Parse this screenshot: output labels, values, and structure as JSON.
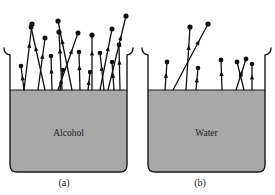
{
  "figure": {
    "background_color": "#ffffff",
    "liquid_fill_color": "#a8a8a8",
    "outline_color": "#1a1a1a",
    "molecule_color": "#111111"
  },
  "panels": [
    {
      "id": "a",
      "caption": "(a)",
      "liquid_label": "Alcohol",
      "beaker": {
        "left": 10,
        "right": 127,
        "top_lip_y": 48,
        "bottom_y": 172,
        "liquid_surface_y": 90
      },
      "escaping_molecules_count": 17,
      "vectors": [
        {
          "x1": 24,
          "y1": 90,
          "x2": 32,
          "y2": 24,
          "tip_r": 2.6,
          "barb_y": 0.72
        },
        {
          "x1": 24,
          "y1": 90,
          "x2": 21,
          "y2": 66,
          "tip_r": 2.3,
          "barb_y": 0.62
        },
        {
          "x1": 38,
          "y1": 90,
          "x2": 45,
          "y2": 38,
          "tip_r": 2.5,
          "barb_y": 0.7
        },
        {
          "x1": 45,
          "y1": 90,
          "x2": 31,
          "y2": 27,
          "tip_r": 2.5,
          "barb_y": 0.7
        },
        {
          "x1": 52,
          "y1": 90,
          "x2": 51,
          "y2": 56,
          "tip_r": 2.3,
          "barb_y": 0.64
        },
        {
          "x1": 60,
          "y1": 90,
          "x2": 63,
          "y2": 70,
          "tip_r": 2.3,
          "barb_y": 0.58
        },
        {
          "x1": 62,
          "y1": 90,
          "x2": 59,
          "y2": 32,
          "tip_r": 2.6,
          "barb_y": 0.72
        },
        {
          "x1": 72,
          "y1": 90,
          "x2": 58,
          "y2": 21,
          "tip_r": 2.6,
          "barb_y": 0.74
        },
        {
          "x1": 58,
          "y1": 90,
          "x2": 78,
          "y2": 33,
          "tip_r": 2.5,
          "barb_y": 0.72
        },
        {
          "x1": 80,
          "y1": 90,
          "x2": 79,
          "y2": 52,
          "tip_r": 2.3,
          "barb_y": 0.66
        },
        {
          "x1": 88,
          "y1": 90,
          "x2": 90,
          "y2": 72,
          "tip_r": 2.2,
          "barb_y": 0.56
        },
        {
          "x1": 92,
          "y1": 90,
          "x2": 92,
          "y2": 35,
          "tip_r": 2.6,
          "barb_y": 0.72
        },
        {
          "x1": 104,
          "y1": 90,
          "x2": 100,
          "y2": 53,
          "tip_r": 2.3,
          "barb_y": 0.66
        },
        {
          "x1": 100,
          "y1": 90,
          "x2": 112,
          "y2": 29,
          "tip_r": 2.5,
          "barb_y": 0.72
        },
        {
          "x1": 114,
          "y1": 90,
          "x2": 112,
          "y2": 62,
          "tip_r": 2.3,
          "barb_y": 0.62
        },
        {
          "x1": 108,
          "y1": 90,
          "x2": 126,
          "y2": 16,
          "tip_r": 2.6,
          "barb_y": 0.74
        },
        {
          "x1": 120,
          "y1": 90,
          "x2": 119,
          "y2": 45,
          "tip_r": 2.4,
          "barb_y": 0.68
        }
      ]
    },
    {
      "id": "b",
      "caption": "(b)",
      "liquid_label": "Water",
      "beaker": {
        "left": 148,
        "right": 265,
        "top_lip_y": 48,
        "bottom_y": 172,
        "liquid_surface_y": 90
      },
      "escaping_molecules_count": 8,
      "vectors": [
        {
          "x1": 165,
          "y1": 90,
          "x2": 167,
          "y2": 62,
          "tip_r": 2.4,
          "barb_y": 0.62
        },
        {
          "x1": 186,
          "y1": 90,
          "x2": 190,
          "y2": 27,
          "tip_r": 2.6,
          "barb_y": 0.72
        },
        {
          "x1": 173,
          "y1": 90,
          "x2": 208,
          "y2": 24,
          "tip_r": 2.6,
          "barb_y": 0.76
        },
        {
          "x1": 196,
          "y1": 90,
          "x2": 198,
          "y2": 68,
          "tip_r": 2.3,
          "barb_y": 0.58
        },
        {
          "x1": 222,
          "y1": 90,
          "x2": 221,
          "y2": 60,
          "tip_r": 2.4,
          "barb_y": 0.64
        },
        {
          "x1": 244,
          "y1": 90,
          "x2": 237,
          "y2": 62,
          "tip_r": 2.4,
          "barb_y": 0.64
        },
        {
          "x1": 236,
          "y1": 90,
          "x2": 246,
          "y2": 59,
          "tip_r": 2.4,
          "barb_y": 0.64
        },
        {
          "x1": 252,
          "y1": 90,
          "x2": 252,
          "y2": 64,
          "tip_r": 2.3,
          "barb_y": 0.6
        }
      ]
    }
  ]
}
